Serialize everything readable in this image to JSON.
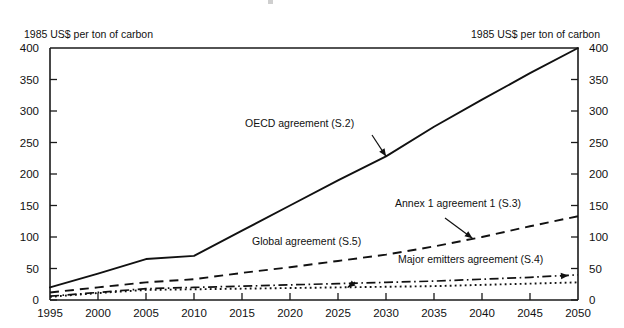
{
  "chart_data": {
    "type": "line",
    "title": "",
    "xlabel": "",
    "ylabel": "1985 US$ per ton of carbon",
    "ylabel_right": "1985 US$ per ton of carbon",
    "xlim": [
      1995,
      2050
    ],
    "ylim": [
      0,
      400
    ],
    "grid": false,
    "legend_position": "inline-annotations",
    "x": [
      1995,
      2000,
      2005,
      2010,
      2015,
      2020,
      2025,
      2030,
      2035,
      2040,
      2045,
      2050
    ],
    "xticklabels": [
      "1995",
      "2000",
      "2005",
      "2010",
      "2015",
      "2020",
      "2025",
      "2030",
      "2035",
      "2040",
      "2045",
      "2050"
    ],
    "yticks": [
      0,
      50,
      100,
      150,
      200,
      250,
      300,
      350,
      400
    ],
    "yticklabels": [
      "0",
      "50",
      "100",
      "150",
      "200",
      "250",
      "300",
      "350",
      "400"
    ],
    "yticks_right": [
      0,
      50,
      100,
      150,
      200,
      250,
      300,
      350,
      400
    ],
    "yticklabels_right": [
      "0",
      "50",
      "100",
      "150",
      "200",
      "250",
      "300",
      "350",
      "400"
    ],
    "series": [
      {
        "name": "OECD agreement (S.2)",
        "style": "solid",
        "values": [
          20,
          42,
          65,
          70,
          110,
          150,
          190,
          228,
          275,
          318,
          360,
          400
        ]
      },
      {
        "name": "Annex 1 agreement 1 (S.3)",
        "style": "dashed",
        "values": [
          12,
          20,
          28,
          33,
          43,
          52,
          62,
          72,
          85,
          100,
          117,
          133
        ]
      },
      {
        "name": "Major emitters agreement (S.4)",
        "style": "dash-dot",
        "values": [
          6,
          12,
          18,
          20,
          22,
          24,
          26,
          28,
          30,
          33,
          36,
          40
        ]
      },
      {
        "name": "Global agreement (S.5)",
        "style": "dotted",
        "values": [
          5,
          11,
          16,
          17,
          18,
          19,
          20,
          21,
          22,
          24,
          26,
          28
        ]
      }
    ],
    "annotations": [
      {
        "text": "OECD agreement (S.2)",
        "points_to_year": 2030,
        "points_to_value": 228
      },
      {
        "text": "Annex 1 agreement 1 (S.3)",
        "points_to_year": 2039,
        "points_to_value": 98
      },
      {
        "text": "Global agreement (S.5)",
        "points_to_year": 2026,
        "points_to_value": 20
      },
      {
        "text": "Major emitters agreement (S.4)",
        "points_to_year": 2049,
        "points_to_value": 39
      }
    ]
  }
}
